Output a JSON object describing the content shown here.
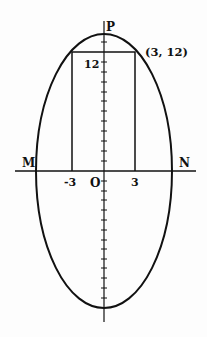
{
  "diagram": {
    "point_top_label": "P",
    "point_left_label": "M",
    "point_right_label": "N",
    "origin_label": "O",
    "corner_label": "(3, 12)",
    "y_tick_label": "12",
    "x_tick_neg_label": "-3",
    "x_tick_pos_label": "3",
    "colors": {
      "line": "#111111",
      "background": "#fdfdfd"
    }
  }
}
